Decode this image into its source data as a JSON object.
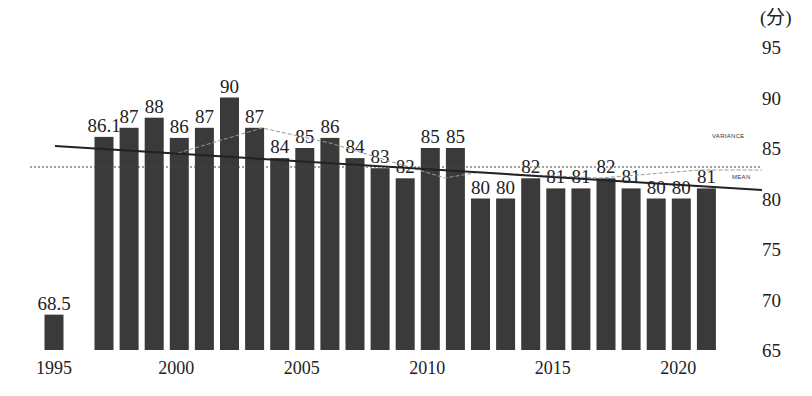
{
  "chart_data": {
    "type": "bar",
    "title": "",
    "xlabel": "",
    "ylabel": "(分)",
    "ylim": [
      65,
      95
    ],
    "yticks": [
      65,
      70,
      75,
      80,
      85,
      90,
      95
    ],
    "xticks": [
      1995,
      2000,
      2005,
      2010,
      2015,
      2020
    ],
    "grid": false,
    "categories": [
      1995,
      1997,
      1998,
      1999,
      2000,
      2001,
      2002,
      2003,
      2004,
      2005,
      2006,
      2007,
      2008,
      2009,
      2010,
      2011,
      2012,
      2013,
      2014,
      2015,
      2016,
      2017,
      2018,
      2019,
      2020,
      2021
    ],
    "values": [
      68.5,
      86.1,
      87,
      88,
      86,
      87,
      90,
      87,
      84,
      85,
      86,
      84,
      83,
      82,
      85,
      85,
      80,
      80,
      82,
      81,
      81,
      82,
      81,
      80,
      80,
      81
    ],
    "labels": [
      "68.5",
      "86.1",
      "87",
      "88",
      "86",
      "87",
      "90",
      "87",
      "84",
      "85",
      "86",
      "84",
      "83",
      "82",
      "85",
      "85",
      "80",
      "80",
      "82",
      "81",
      "81",
      "82",
      "81",
      "80",
      "80",
      "81"
    ],
    "annotations": [
      {
        "text": "VARIANCE",
        "type": "dashed-line-label"
      },
      {
        "text": "MEAN",
        "type": "dotted-line-label",
        "value": 83.4
      }
    ],
    "trend_line": {
      "start": [
        1993.5,
        85.7
      ],
      "end": [
        2022.5,
        81.2
      ]
    },
    "bar_color": "#3a3a3a"
  },
  "axis": {
    "unit_label": "(分)",
    "y_labels": [
      "95",
      "90",
      "85",
      "80",
      "75",
      "70",
      "65"
    ],
    "x_labels": [
      "1995",
      "2000",
      "2005",
      "2010",
      "2015",
      "2020"
    ]
  },
  "legend": {
    "variance": "VARIANCE",
    "mean": "MEAN"
  }
}
